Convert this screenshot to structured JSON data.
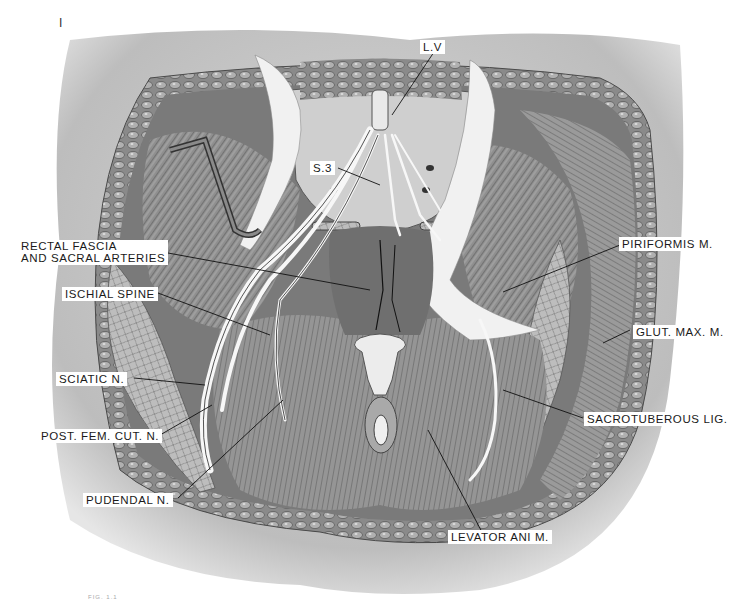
{
  "figure": {
    "corner_mark": "I",
    "caption_faint": "FIG. 1.1",
    "colors": {
      "background": "#ffffff",
      "skin": "#cfcfcf",
      "fat": "#9a9a9a",
      "muscle": "#8c8c8c",
      "muscle_dark": "#5a5a5a",
      "nerve": "#f4f4f4",
      "ligament": "#ececec",
      "leader_line": "#111111"
    }
  },
  "labels": [
    {
      "id": "l5",
      "text": "L.V"
    },
    {
      "id": "s3",
      "text": "S.3"
    },
    {
      "id": "rectal",
      "line1": "RECTAL FASCIA",
      "line2": "AND SACRAL ARTERIES"
    },
    {
      "id": "ischial",
      "text": "ISCHIAL SPINE"
    },
    {
      "id": "sciatic",
      "text": "SCIATIC N."
    },
    {
      "id": "postfem",
      "text": "POST. FEM. CUT. N."
    },
    {
      "id": "pudendal",
      "text": "PUDENDAL N."
    },
    {
      "id": "piriformis",
      "text": "PIRIFORMIS M."
    },
    {
      "id": "glut",
      "text": "GLUT. MAX. M."
    },
    {
      "id": "sacrotub",
      "text": "SACROTUBEROUS LIG."
    },
    {
      "id": "levator",
      "text": "LEVATOR ANI M."
    }
  ]
}
